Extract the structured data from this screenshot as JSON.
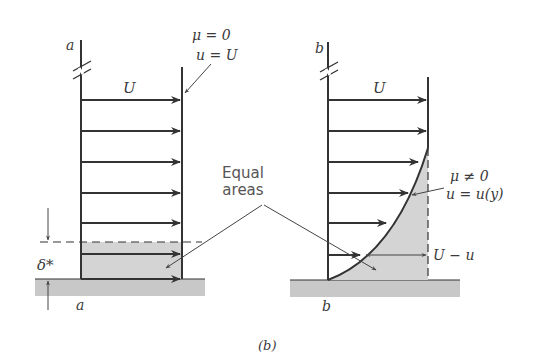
{
  "figure": {
    "caption": "(b)",
    "colors": {
      "line": "#333333",
      "shade": "#d4d4d4",
      "ground": "#c8c8c8",
      "text": "#3a3a3a"
    }
  },
  "panel_a": {
    "station_label_top": "a",
    "station_label_bottom": "a",
    "velocity_label": "U",
    "condition_mu": "μ = 0",
    "condition_u": "u = U",
    "displacement_label": "δ*"
  },
  "panel_b": {
    "station_label_top": "b",
    "station_label_bottom": "b",
    "velocity_label": "U",
    "condition_mu": "μ ≠ 0",
    "condition_u": "u = u(y)",
    "deficit_label": "U − u"
  },
  "center": {
    "equal_areas_line1": "Equal",
    "equal_areas_line2": "areas"
  }
}
